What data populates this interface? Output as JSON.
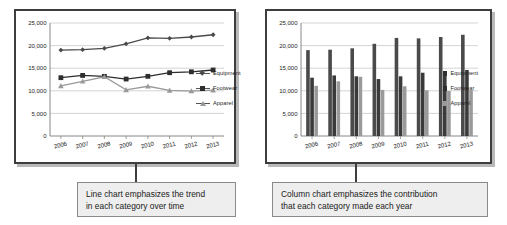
{
  "figure": {
    "background": "#ffffff",
    "frame_color": "#3d3d3d",
    "caption_bg": "#eeeeee"
  },
  "series_colors": {
    "equipment": "#4a4a4a",
    "footwear": "#2e2e2e",
    "apparel": "#9a9a9a"
  },
  "legend": {
    "equipment": "Equipment",
    "footwear": "Footwear",
    "apparel": "Apparel"
  },
  "captions": {
    "left_line_1": "Line chart emphasizes the trend",
    "left_line_2": "in each category over time",
    "right_line_1": "Column chart emphasizes the contribution",
    "right_line_2": "that each category made each year"
  },
  "axis": {
    "y_ticks": [
      "25,000",
      "20,000",
      "15,000",
      "10,000",
      "5,000",
      "0"
    ],
    "x_ticks": [
      "2006",
      "2007",
      "2008",
      "2009",
      "2010",
      "2011",
      "2012",
      "2013"
    ]
  },
  "chart_data": [
    {
      "type": "line",
      "title": "",
      "xlabel": "",
      "ylabel": "",
      "categories": [
        "2006",
        "2007",
        "2008",
        "2009",
        "2010",
        "2011",
        "2012",
        "2013"
      ],
      "ylim": [
        0,
        25000
      ],
      "ytick_step": 5000,
      "grid": true,
      "legend_position": "right",
      "series": [
        {
          "name": "Equipment",
          "marker": "diamond",
          "color": "#4a4a4a",
          "values": [
            19000,
            19100,
            19400,
            20400,
            21700,
            21600,
            21900,
            22400
          ]
        },
        {
          "name": "Footwear",
          "marker": "square",
          "color": "#2e2e2e",
          "values": [
            12900,
            13400,
            13200,
            12600,
            13200,
            14000,
            14200,
            14600
          ]
        },
        {
          "name": "Apparel",
          "marker": "triangle",
          "color": "#9a9a9a",
          "values": [
            11100,
            12100,
            13100,
            10200,
            11000,
            10100,
            9950,
            10150
          ]
        }
      ]
    },
    {
      "type": "bar",
      "title": "",
      "xlabel": "",
      "ylabel": "",
      "categories": [
        "2006",
        "2007",
        "2008",
        "2009",
        "2010",
        "2011",
        "2012",
        "2013"
      ],
      "ylim": [
        0,
        25000
      ],
      "ytick_step": 5000,
      "grid": true,
      "legend_position": "right",
      "series": [
        {
          "name": "Equipment",
          "color": "#4a4a4a",
          "values": [
            19000,
            19100,
            19400,
            20400,
            21700,
            21600,
            21900,
            22400
          ]
        },
        {
          "name": "Footwear",
          "color": "#3a3a3a",
          "values": [
            12900,
            13400,
            13200,
            12600,
            13200,
            14000,
            14200,
            14600
          ]
        },
        {
          "name": "Apparel",
          "color": "#9a9a9a",
          "values": [
            11100,
            12100,
            13100,
            10200,
            11000,
            10100,
            9950,
            10150
          ]
        }
      ]
    }
  ]
}
